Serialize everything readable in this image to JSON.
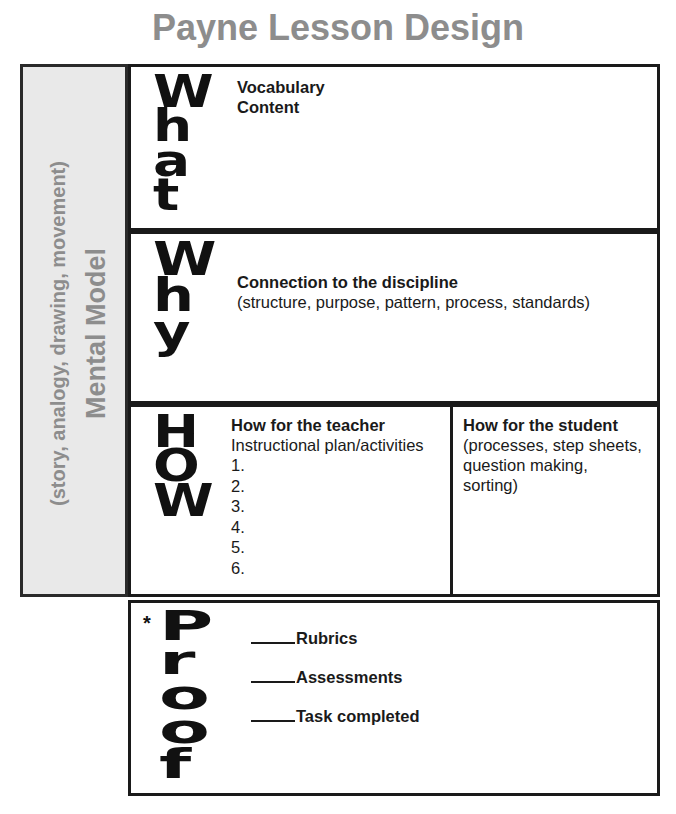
{
  "page": {
    "title": "Payne Lesson Design",
    "title_color": "#8d8d8d"
  },
  "sidebar": {
    "name": "Mental Model",
    "heading": "Mental Model",
    "subtitle": "(story, analogy, drawing, movement)",
    "background": "#e9e9e9",
    "text_color": "#8d8d8d"
  },
  "rows": {
    "what": {
      "word": "What",
      "letters": [
        "W",
        "h",
        "a",
        "t"
      ],
      "lines": [
        {
          "text": "Vocabulary",
          "style": "bold"
        },
        {
          "text": "Content",
          "style": "bold"
        }
      ]
    },
    "why": {
      "word": "Why",
      "letters": [
        "W",
        "h",
        "y"
      ],
      "lines": [
        {
          "text": "Connection to the discipline",
          "style": "bold"
        },
        {
          "text": "(structure, purpose, pattern, process, standards)",
          "style": "plain"
        }
      ]
    },
    "how": {
      "word": "How",
      "letters": [
        "H",
        "O",
        "W"
      ],
      "teacher": {
        "heading": "How for the teacher",
        "subheading": "Instructional plan/activities",
        "items": [
          "1.",
          "2.",
          "3.",
          "4.",
          "5.",
          "6."
        ]
      },
      "student": {
        "heading": "How for the student",
        "lines": [
          "(processes, step sheets,",
          "question making, sorting)"
        ]
      }
    },
    "proof": {
      "word": "Proof",
      "letters": [
        "P",
        "r",
        "o",
        "o",
        "f"
      ],
      "asterisk": "*",
      "checklist": [
        "Rubrics",
        "Assessments",
        "Task completed"
      ]
    }
  }
}
